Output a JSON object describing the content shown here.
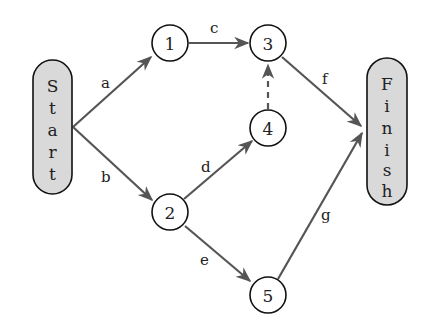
{
  "diagram": {
    "type": "network / activity-on-arrow project graph",
    "colors": {
      "edge": "#555555",
      "terminal_fill": "#d9d9d9",
      "node_stroke": "#111111"
    },
    "terminals": {
      "start": {
        "label": "Start",
        "letters": [
          "S",
          "t",
          "a",
          "r",
          "t"
        ]
      },
      "finish": {
        "label": "Finish",
        "letters": [
          "F",
          "i",
          "n",
          "i",
          "s",
          "h"
        ]
      }
    },
    "nodes": [
      {
        "id": "1",
        "label": "1"
      },
      {
        "id": "2",
        "label": "2"
      },
      {
        "id": "3",
        "label": "3"
      },
      {
        "id": "4",
        "label": "4"
      },
      {
        "id": "5",
        "label": "5"
      }
    ],
    "edges": [
      {
        "label": "a",
        "from": "Start",
        "to": "1",
        "style": "solid"
      },
      {
        "label": "b",
        "from": "Start",
        "to": "2",
        "style": "solid"
      },
      {
        "label": "c",
        "from": "1",
        "to": "3",
        "style": "solid"
      },
      {
        "label": "d",
        "from": "2",
        "to": "4",
        "style": "solid"
      },
      {
        "label": "e",
        "from": "2",
        "to": "5",
        "style": "solid"
      },
      {
        "label": "f",
        "from": "3",
        "to": "Finish",
        "style": "solid"
      },
      {
        "label": "g",
        "from": "5",
        "to": "Finish",
        "style": "solid"
      },
      {
        "label": "",
        "from": "4",
        "to": "3",
        "style": "dashed"
      }
    ]
  }
}
